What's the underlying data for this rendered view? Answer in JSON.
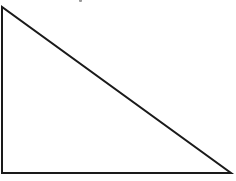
{
  "diagram": {
    "type": "right-triangle",
    "stroke_color": "#1a1a1a",
    "fill_color": "#ffffff",
    "stroke_width": 2,
    "vertices": {
      "top": [
        2,
        7
      ],
      "bottom_left": [
        2,
        173
      ],
      "bottom_right": [
        231,
        173
      ]
    },
    "labels": []
  }
}
